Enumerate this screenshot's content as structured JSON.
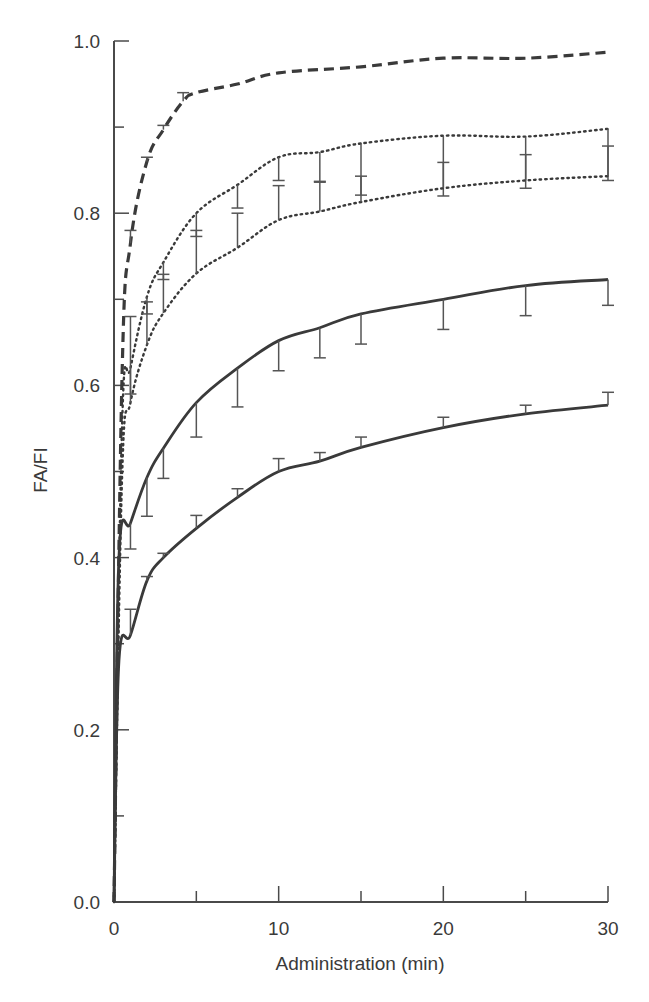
{
  "chart_data": {
    "type": "line",
    "title": "",
    "xlabel": "Administration (min)",
    "ylabel": "FA/FI",
    "xlim": [
      0,
      30
    ],
    "ylim": [
      0.0,
      1.0
    ],
    "x_ticks": [
      0,
      10,
      20,
      30
    ],
    "x_minor_ticks": [
      5,
      15,
      25
    ],
    "x_tick_labels": [
      "0",
      "10",
      "20",
      "30"
    ],
    "y_ticks": [
      0.0,
      0.2,
      0.4,
      0.6,
      0.8,
      1.0
    ],
    "y_minor_ticks": [
      0.1,
      0.3,
      0.5,
      0.7,
      0.9
    ],
    "y_tick_labels": [
      "0.0",
      "0.2",
      "0.4",
      "0.6",
      "0.8",
      "1.0"
    ],
    "grid": false,
    "legend": null,
    "series": [
      {
        "name": "dashed",
        "style": "dashed",
        "color": "#3a3a3a",
        "x": [
          0,
          0.5,
          1,
          2,
          3,
          4.2,
          5,
          7.5,
          10,
          15,
          20,
          25,
          30
        ],
        "values": [
          0,
          0.62,
          0.765,
          0.86,
          0.897,
          0.93,
          0.94,
          0.95,
          0.963,
          0.97,
          0.98,
          0.98,
          0.987
        ],
        "err_up": [
          0,
          0,
          0.015,
          0.005,
          0.005,
          0.01,
          0,
          0,
          0,
          0,
          0,
          0,
          0
        ]
      },
      {
        "name": "dotted-upper",
        "style": "dotted",
        "color": "#3a3a3a",
        "x": [
          0,
          0.5,
          1,
          2,
          3,
          5,
          7.5,
          10,
          12.5,
          15,
          20,
          25,
          30
        ],
        "values": [
          0,
          0.56,
          0.62,
          0.703,
          0.743,
          0.8,
          0.833,
          0.865,
          0.871,
          0.881,
          0.89,
          0.889,
          0.898
        ],
        "err_down": [
          0,
          0,
          0.03,
          0.02,
          0.02,
          0.027,
          0.027,
          0.027,
          0.035,
          0.06,
          0.07,
          0.06,
          0.06
        ]
      },
      {
        "name": "dotted-lower",
        "style": "dotted",
        "color": "#3a3a3a",
        "x": [
          0,
          0.5,
          1,
          2,
          3,
          5,
          7.5,
          10,
          12.5,
          15,
          20,
          25,
          30
        ],
        "values": [
          0,
          0.5,
          0.58,
          0.647,
          0.684,
          0.73,
          0.76,
          0.792,
          0.802,
          0.813,
          0.829,
          0.838,
          0.843
        ],
        "err_up": [
          0,
          0,
          0.1,
          0.05,
          0.045,
          0.05,
          0.04,
          0.04,
          0.035,
          0.03,
          0.03,
          0.03,
          0.035
        ]
      },
      {
        "name": "solid-upper",
        "style": "solid",
        "color": "#3a3a3a",
        "x": [
          0,
          0.3,
          1,
          2,
          3,
          5,
          7.5,
          10,
          12.5,
          15,
          20,
          25,
          30
        ],
        "values": [
          0,
          0.4,
          0.44,
          0.493,
          0.527,
          0.58,
          0.62,
          0.652,
          0.667,
          0.683,
          0.7,
          0.716,
          0.723
        ],
        "err_down": [
          0,
          0,
          0.03,
          0.045,
          0.035,
          0.04,
          0.045,
          0.035,
          0.035,
          0.035,
          0.035,
          0.035,
          0.03
        ]
      },
      {
        "name": "solid-lower",
        "style": "solid",
        "color": "#3a3a3a",
        "x": [
          0,
          0.3,
          1,
          2,
          3,
          5,
          7.5,
          10,
          12.5,
          15,
          20,
          25,
          30
        ],
        "values": [
          0,
          0.28,
          0.31,
          0.373,
          0.4,
          0.434,
          0.47,
          0.5,
          0.512,
          0.528,
          0.551,
          0.567,
          0.577
        ],
        "err_up": [
          0,
          0,
          0.03,
          0.005,
          0.005,
          0.015,
          0.01,
          0.015,
          0.01,
          0.012,
          0.012,
          0.01,
          0.015
        ]
      }
    ]
  }
}
